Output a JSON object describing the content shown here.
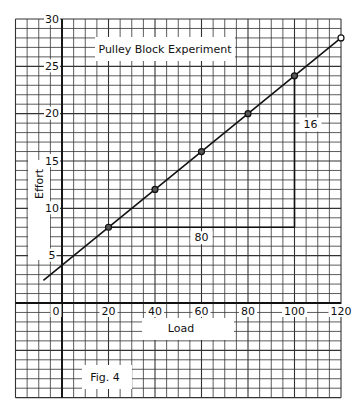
{
  "chart_data": {
    "type": "line",
    "title": "Pulley Block Experiment",
    "xlabel": "Load",
    "ylabel": "Effort",
    "annotation": "Fig. 4",
    "x": [
      20,
      40,
      60,
      80,
      100,
      120
    ],
    "series": [
      {
        "name": "Effort",
        "values": [
          8,
          12,
          16,
          20,
          24,
          28
        ]
      }
    ],
    "fit_line": {
      "slope": 0.2,
      "intercept": 4,
      "x_range": [
        -8,
        120
      ]
    },
    "gradient_triangle": {
      "horizontal_label": "80",
      "vertical_label": "16",
      "from": [
        20,
        8
      ],
      "to": [
        100,
        24
      ]
    },
    "xlim": [
      -20,
      120
    ],
    "ylim": [
      -10,
      30
    ],
    "xticks": [
      0,
      20,
      40,
      60,
      80,
      100,
      120
    ],
    "xtick_labels": [
      "0",
      "20",
      "40",
      "60",
      "80",
      "100",
      "120"
    ],
    "yticks": [
      5,
      10,
      15,
      20,
      25,
      30
    ],
    "ytick_labels": [
      "5",
      "10",
      "15",
      "20",
      "25",
      "30"
    ],
    "grid": true,
    "colors": {
      "ink": "#111111",
      "grid": "#333333",
      "paper": "#ffffff"
    }
  }
}
